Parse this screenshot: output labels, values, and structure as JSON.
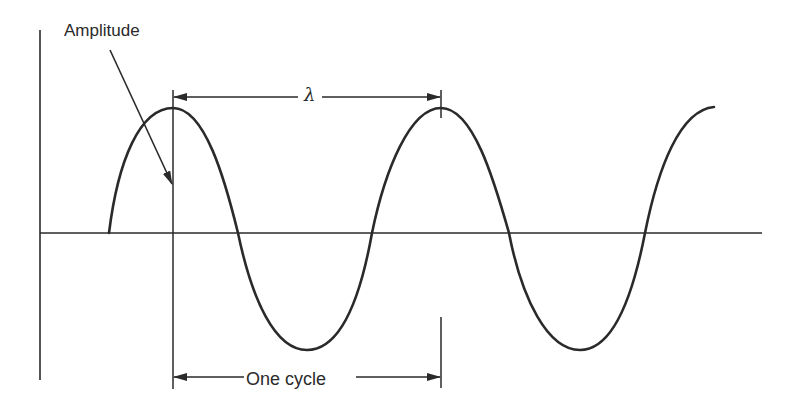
{
  "diagram": {
    "type": "sine-wave-annotation",
    "labels": {
      "amplitude": "Amplitude",
      "wavelength": "λ",
      "cycle": "One cycle"
    },
    "colors": {
      "ink": "#2a2a2a",
      "background": "#ffffff"
    },
    "annotations": [
      {
        "name": "amplitude",
        "kind": "pointer-arrow",
        "target": "peak height at first crest"
      },
      {
        "name": "wavelength",
        "kind": "double-arrow",
        "span": "crest to crest"
      },
      {
        "name": "one-cycle",
        "kind": "double-arrow",
        "span": "one full period"
      }
    ],
    "wave": {
      "cycles_shown": 2.3,
      "peaks": 3,
      "troughs": 2
    }
  }
}
